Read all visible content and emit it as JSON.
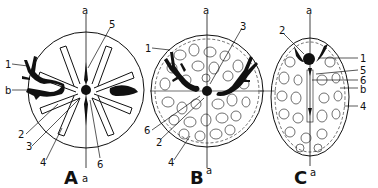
{
  "panels": [
    {
      "id": "A",
      "caption": "A",
      "axis_label_top": "a",
      "axis_label_bottom": "a",
      "labels": [
        "1",
        "b",
        "2",
        "3",
        "4",
        "5",
        "6"
      ]
    },
    {
      "id": "B",
      "caption": "B",
      "axis_label_top": "a",
      "axis_label_bottom": "a",
      "labels": [
        "1",
        "2",
        "3",
        "4",
        "6"
      ]
    },
    {
      "id": "C",
      "caption": "C",
      "axis_label_top": "a",
      "axis_label_bottom": "a",
      "labels": [
        "2",
        "1",
        "5",
        "6",
        "b",
        "4"
      ]
    }
  ],
  "colors": {
    "ink": "#111111",
    "background": "#ffffff"
  }
}
